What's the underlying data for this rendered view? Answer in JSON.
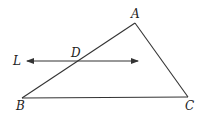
{
  "diagram": {
    "type": "geometry-figure",
    "points": [
      {
        "id": "A",
        "label": "A"
      },
      {
        "id": "B",
        "label": "B"
      },
      {
        "id": "C",
        "label": "C"
      },
      {
        "id": "D",
        "label": "D"
      }
    ],
    "line": {
      "id": "L",
      "label": "L",
      "bidirectional": true
    },
    "segments": [
      "AB",
      "BC",
      "CA"
    ],
    "colors": {
      "stroke": "#333333",
      "text": "#222222"
    }
  }
}
